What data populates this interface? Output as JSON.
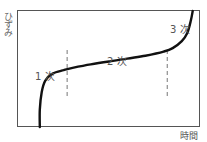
{
  "figure": {
    "title": "",
    "y_axis_label": "ひずみ",
    "x_axis_label": "時間",
    "stage_labels": [
      "1 次",
      "2 次",
      "3 次"
    ],
    "colors": {
      "curve": "#111111",
      "frame": "#555555",
      "divider": "#777777",
      "text": "#555555"
    }
  },
  "chart_data": {
    "type": "line",
    "title": "",
    "xlabel": "時間",
    "ylabel": "ひずみ",
    "xlim": [
      0,
      1
    ],
    "ylim": [
      0,
      1
    ],
    "grid": false,
    "ticks": false,
    "series": [
      {
        "name": "creep curve",
        "x": [
          0.12,
          0.12,
          0.13,
          0.15,
          0.19,
          0.25,
          0.3,
          0.4,
          0.5,
          0.6,
          0.7,
          0.8,
          0.85,
          0.9,
          0.93,
          0.95,
          0.96
        ],
        "y": [
          0.0,
          0.15,
          0.3,
          0.4,
          0.46,
          0.49,
          0.51,
          0.54,
          0.565,
          0.59,
          0.615,
          0.65,
          0.68,
          0.74,
          0.81,
          0.92,
          1.0
        ]
      }
    ],
    "dividers_x": [
      0.27,
      0.82
    ],
    "regions": [
      {
        "label": "1 次",
        "name": "primary creep"
      },
      {
        "label": "2 次",
        "name": "secondary creep"
      },
      {
        "label": "3 次",
        "name": "tertiary creep"
      }
    ]
  }
}
